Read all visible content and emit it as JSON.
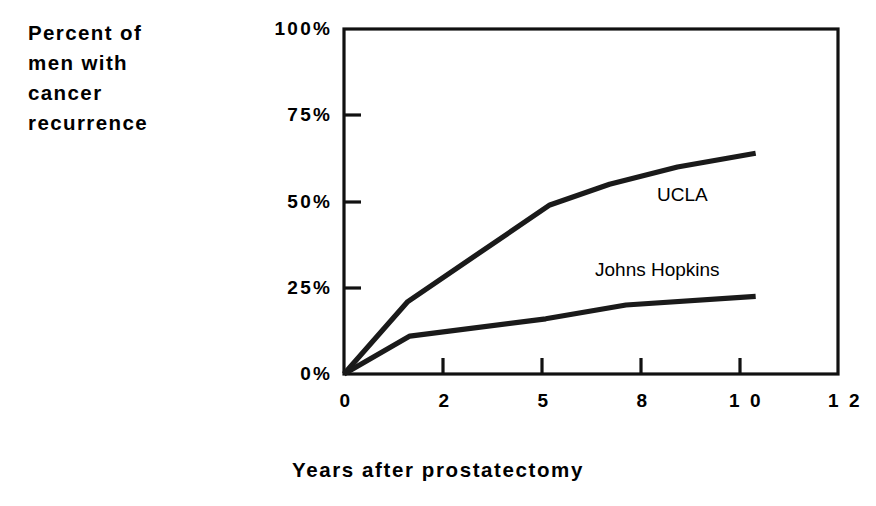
{
  "chart_data": {
    "type": "line",
    "title": "",
    "subtitle": "",
    "ylabel": "Percent of\nmen with\ncancer\nrecurrence",
    "xlabel": "Years after prostatectomy",
    "grid": false,
    "legend_position": "inline-annotation",
    "xlim": [
      0,
      12
    ],
    "ylim": [
      0,
      100
    ],
    "x_tick_labels": [
      "0",
      "2",
      "5",
      "8",
      "1 0",
      "1 2"
    ],
    "x_tick_values": [
      0,
      2,
      5,
      8,
      10,
      12
    ],
    "y_tick_labels": [
      "100%",
      "75%",
      "50%",
      "25%",
      "0%"
    ],
    "y_tick_values": [
      100,
      75,
      50,
      25,
      0
    ],
    "series": [
      {
        "name": "UCLA",
        "annotation": "UCLA",
        "x": [
          0,
          1.55,
          5.0,
          6.45,
          8.1,
          10
        ],
        "values": [
          0,
          21,
          49,
          55,
          60,
          64
        ]
      },
      {
        "name": "Johns Hopkins",
        "annotation": "Johns Hopkins",
        "x": [
          0,
          1.6,
          4.9,
          6.85,
          10
        ],
        "values": [
          0,
          11,
          16,
          20,
          22.5
        ]
      }
    ]
  },
  "axes": {
    "y_title": "Percent of\nmen with\ncancer\nrecurrence",
    "x_title": "Years after prostatectomy"
  },
  "annotations": {
    "ucla": "UCLA",
    "johns_hopkins": "Johns Hopkins"
  },
  "colors": {
    "background": "#ffffff",
    "ink": "#000000",
    "line": "#1a1a1a"
  }
}
